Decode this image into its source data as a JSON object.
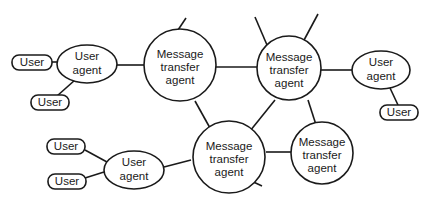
{
  "diagram": {
    "type": "network-topology",
    "labels": {
      "mta": [
        "Message",
        "transfer",
        "agent"
      ],
      "ua": [
        "User",
        "agent"
      ],
      "user": "User"
    },
    "colors": {
      "stroke": "#1a1a1a",
      "fill": "#ffffff"
    },
    "nodes": [
      {
        "id": "mta1",
        "kind": "message-transfer-agent",
        "label": "Message transfer agent"
      },
      {
        "id": "mta2",
        "kind": "message-transfer-agent",
        "label": "Message transfer agent"
      },
      {
        "id": "mta3",
        "kind": "message-transfer-agent",
        "label": "Message transfer agent"
      },
      {
        "id": "mta4",
        "kind": "message-transfer-agent",
        "label": "Message transfer agent"
      },
      {
        "id": "ua1",
        "kind": "user-agent",
        "label": "User agent"
      },
      {
        "id": "ua2",
        "kind": "user-agent",
        "label": "User agent"
      },
      {
        "id": "ua3",
        "kind": "user-agent",
        "label": "User agent"
      },
      {
        "id": "user1",
        "kind": "user",
        "label": "User"
      },
      {
        "id": "user2",
        "kind": "user",
        "label": "User"
      },
      {
        "id": "user3",
        "kind": "user",
        "label": "User"
      },
      {
        "id": "user4",
        "kind": "user",
        "label": "User"
      },
      {
        "id": "user5",
        "kind": "user",
        "label": "User"
      }
    ],
    "edges": [
      [
        "user1",
        "ua1"
      ],
      [
        "user2",
        "ua1"
      ],
      [
        "ua1",
        "mta1"
      ],
      [
        "mta1",
        "mta2"
      ],
      [
        "mta1",
        "mta3"
      ],
      [
        "mta2",
        "mta3"
      ],
      [
        "mta2",
        "mta4"
      ],
      [
        "mta3",
        "mta4"
      ],
      [
        "mta2",
        "ua2"
      ],
      [
        "ua2",
        "user3"
      ],
      [
        "mta3",
        "ua3"
      ],
      [
        "ua3",
        "user4"
      ],
      [
        "ua3",
        "user5"
      ]
    ],
    "dangling_edges": [
      "mta1-up",
      "mta2-up-left",
      "mta2-up-right",
      "mta3-down-right"
    ]
  }
}
